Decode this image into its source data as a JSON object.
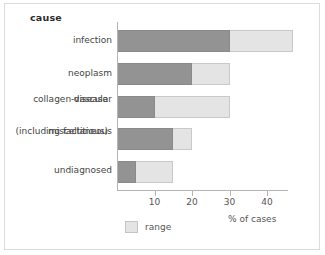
{
  "chart_data": {
    "type": "bar",
    "orientation": "horizontal",
    "title": "cause",
    "xlabel": "% of cases",
    "ylabel": "cause",
    "xlim": [
      0,
      46
    ],
    "xticks": [
      10,
      20,
      30,
      40
    ],
    "grid": false,
    "legend": {
      "position": "bottom-left",
      "entries": [
        {
          "name": "range",
          "color": "#e4e4e4"
        }
      ]
    },
    "colors": {
      "main": "#939393",
      "range": "#e4e4e4",
      "axis": "#b4b4b4",
      "text": "#444444",
      "frame": "#dcdcdc"
    },
    "categories": [
      "infection",
      "neoplasm",
      "collagen-vascular disease",
      "miscellaneous (including factitious)",
      "undiagnosed"
    ],
    "category_lines": [
      [
        "infection"
      ],
      [
        "neoplasm"
      ],
      [
        "collagen-vascular",
        "disease"
      ],
      [
        "miscellaneous",
        "(including factitious)"
      ],
      [
        "undiagnosed"
      ]
    ],
    "series": [
      {
        "name": "value",
        "values": [
          30,
          20,
          10,
          15,
          5
        ]
      },
      {
        "name": "range",
        "values": [
          47,
          30,
          30,
          20,
          15
        ]
      }
    ],
    "bars": [
      {
        "category": "infection",
        "value": 30,
        "range_end": 47
      },
      {
        "category": "neoplasm",
        "value": 20,
        "range_end": 30
      },
      {
        "category": "collagen-vascular disease",
        "value": 10,
        "range_end": 30
      },
      {
        "category": "miscellaneous (including factitious)",
        "value": 15,
        "range_end": 20
      },
      {
        "category": "undiagnosed",
        "value": 5,
        "range_end": 15
      }
    ]
  },
  "axis": {
    "tick_labels": [
      "10",
      "20",
      "30",
      "40"
    ],
    "caption": "% of cases"
  },
  "legend": {
    "range_label": "range"
  }
}
